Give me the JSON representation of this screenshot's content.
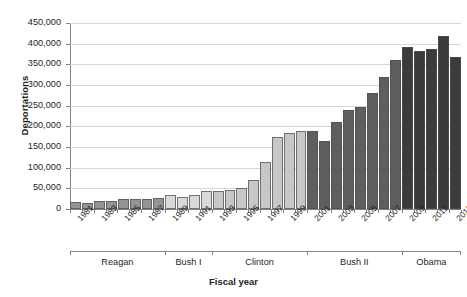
{
  "chart_data": {
    "type": "bar",
    "title": "",
    "xlabel": "Fiscal year",
    "ylabel": "Deportations",
    "ylim": [
      0,
      450000
    ],
    "ytick_labels": [
      "450,000",
      "400,000",
      "350,000",
      "300,000",
      "250,000",
      "200,000",
      "150,000",
      "100,000",
      "50,000",
      "0"
    ],
    "ytick_values": [
      450000,
      400000,
      350000,
      300000,
      250000,
      200000,
      150000,
      100000,
      50000,
      0
    ],
    "grid": true,
    "legend": "none",
    "x": [
      1981,
      1982,
      1983,
      1984,
      1985,
      1986,
      1987,
      1988,
      1989,
      1990,
      1991,
      1992,
      1993,
      1994,
      1995,
      1996,
      1997,
      1998,
      1999,
      2000,
      2001,
      2002,
      2003,
      2004,
      2005,
      2006,
      2007,
      2008,
      2009,
      2010,
      2011,
      2012,
      2013
    ],
    "xtick_labels": [
      "1981",
      "1983",
      "1985",
      "1987",
      "1989",
      "1991",
      "1993",
      "1995",
      "1997",
      "1999",
      "2001",
      "2003",
      "2005",
      "2007",
      "2009",
      "2011",
      "2013"
    ],
    "values": [
      17379,
      15216,
      19211,
      18696,
      23105,
      24592,
      24336,
      25829,
      34427,
      30039,
      33189,
      43671,
      42542,
      45674,
      50924,
      69680,
      114432,
      174813,
      183114,
      188467,
      189026,
      165168,
      211098,
      240665,
      246431,
      280974,
      319382,
      359795,
      391341,
      382409,
      387242,
      419384,
      368644
    ],
    "categories": [
      "1981",
      "1982",
      "1983",
      "1984",
      "1985",
      "1986",
      "1987",
      "1988",
      "1989",
      "1990",
      "1991",
      "1992",
      "1993",
      "1994",
      "1995",
      "1996",
      "1997",
      "1998",
      "1999",
      "2000",
      "2001",
      "2002",
      "2003",
      "2004",
      "2005",
      "2006",
      "2007",
      "2008",
      "2009",
      "2010",
      "2011",
      "2012",
      "2013"
    ],
    "eras": [
      {
        "label": "Reagan",
        "start": 1981,
        "end": 1988,
        "color": "#949494"
      },
      {
        "label": "Bush I",
        "start": 1989,
        "end": 1992,
        "color": "#d9d9d9"
      },
      {
        "label": "Clinton",
        "start": 1993,
        "end": 2000,
        "color": "#c7c7c7"
      },
      {
        "label": "Bush II",
        "start": 2001,
        "end": 2008,
        "color": "#5e5e5e"
      },
      {
        "label": "Obama",
        "start": 2009,
        "end": 2013,
        "color": "#3b3b3b"
      }
    ],
    "colors": {
      "reagan": "#949494",
      "bush_i": "#d9d9d9",
      "clinton": "#c7c7c7",
      "bush_ii": "#5e5e5e",
      "obama": "#3b3b3b",
      "grid": "#d6d6d6",
      "axis": "#808285",
      "text": "#231f20"
    }
  }
}
